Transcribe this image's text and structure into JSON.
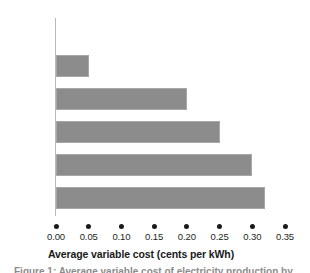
{
  "chart_data": {
    "type": "bar",
    "orientation": "horizontal",
    "title": "",
    "xlabel": "Average variable cost (cents per kWh)",
    "ylabel": "",
    "xlim": [
      0.0,
      0.35
    ],
    "xticks": [
      "0.00",
      "0.05",
      "0.10",
      "0.15",
      "0.20",
      "0.25",
      "0.30",
      "0.35"
    ],
    "xtick_values": [
      0.0,
      0.05,
      0.1,
      0.15,
      0.2,
      0.25,
      0.3,
      0.35
    ],
    "grid": false,
    "legend": false,
    "categories": [
      "Wind",
      "Nuclear",
      "Gas-oil",
      "Hydro",
      "Coal",
      "Turbine"
    ],
    "values": [
      0.0,
      0.05,
      0.2,
      0.25,
      0.3,
      0.32
    ],
    "bar_color": "#8c8c8c",
    "bar_edge_color": "#a8a8a8",
    "axis_color": "#b9b9b9",
    "text_color": "#231f20"
  },
  "bars": [
    {
      "label": "Wind",
      "value": 0.0
    },
    {
      "label": "Nuclear",
      "value": 0.05
    },
    {
      "label": "Gas-oil",
      "value": 0.2
    },
    {
      "label": "Hydro",
      "value": 0.25
    },
    {
      "label": "Coal",
      "value": 0.3
    },
    {
      "label": "Turbine",
      "value": 0.32
    }
  ],
  "axis": {
    "title": "Average variable cost (cents per kWh)",
    "ticks": [
      "0.00",
      "0.05",
      "0.10",
      "0.15",
      "0.20",
      "0.25",
      "0.30",
      "0.35"
    ]
  },
  "caption_sliver": "Figure 1: Average variable cost of electricity production by"
}
